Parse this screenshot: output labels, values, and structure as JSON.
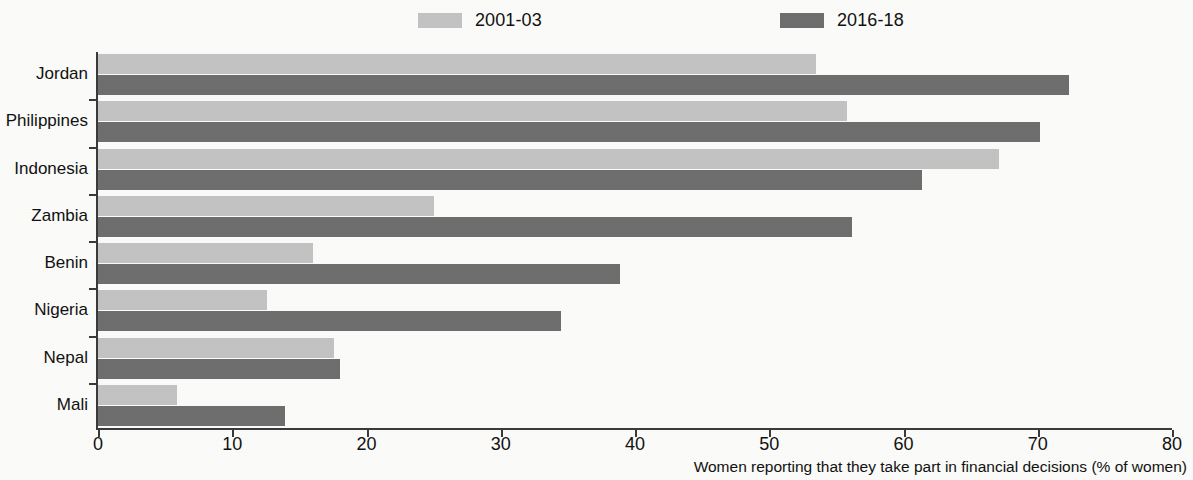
{
  "legend": {
    "items": [
      {
        "label": "2001-03",
        "color": "#c3c3c3",
        "name": "series-2001-03"
      },
      {
        "label": "2016-18",
        "color": "#6e6e6e",
        "name": "series-2016-18"
      }
    ]
  },
  "axis": {
    "x_title": "Women reporting that they take part in financial decisions (% of women)",
    "ticks": [
      "0",
      "10",
      "20",
      "30",
      "40",
      "50",
      "60",
      "70",
      "80"
    ]
  },
  "chart_data": {
    "type": "bar",
    "orientation": "horizontal",
    "title": "",
    "subtitle": "",
    "xlabel": "Women reporting that they take part in financial decisions (% of women)",
    "ylabel": "",
    "xlim": [
      0,
      80
    ],
    "xticks": [
      0,
      10,
      20,
      30,
      40,
      50,
      60,
      70,
      80
    ],
    "grid": false,
    "legend_position": "top",
    "categories": [
      "Jordan",
      "Philippines",
      "Indonesia",
      "Zambia",
      "Benin",
      "Nigeria",
      "Nepal",
      "Mali"
    ],
    "series": [
      {
        "name": "2001-03",
        "color": "#c3c3c3",
        "values": [
          53.5,
          55.8,
          67.1,
          25.0,
          16.0,
          12.6,
          17.6,
          5.9
        ]
      },
      {
        "name": "2016-18",
        "color": "#6e6e6e",
        "values": [
          72.3,
          70.2,
          61.4,
          56.2,
          38.9,
          34.5,
          18.0,
          13.9
        ]
      }
    ]
  }
}
